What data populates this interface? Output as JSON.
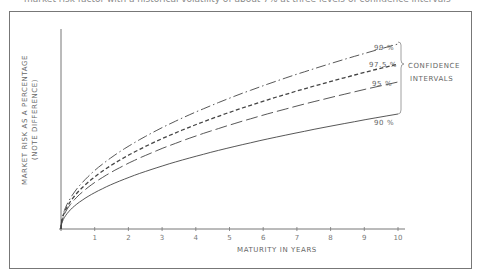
{
  "caption": "market risk factor with a historical volatility of about 7% at three levels of confidence intervals",
  "chart_data": {
    "type": "line",
    "title": "",
    "xlabel": "MATURITY IN YEARS",
    "ylabel": "MARKET RISK AS A PERCENTAGE",
    "ylabel_note": "(NOTE DIFFERENCE)",
    "x_ticks": [
      "1",
      "2",
      "3",
      "4",
      "5",
      "6",
      "7",
      "8",
      "9",
      "10"
    ],
    "xlim": [
      0,
      10
    ],
    "ylim": [
      0,
      100
    ],
    "y_ticks": [],
    "grid": false,
    "x": [
      0,
      0.25,
      0.5,
      1,
      2,
      3,
      4,
      5,
      6,
      7,
      8,
      9,
      10
    ],
    "series": [
      {
        "name": "99 %",
        "style": "dash-dot",
        "values": [
          0,
          14.6,
          20.7,
          29.2,
          41.4,
          50.7,
          58.5,
          65.4,
          71.6,
          77.4,
          82.7,
          87.8,
          92.5
        ]
      },
      {
        "name": "97.5 %",
        "style": "short-dash",
        "values": [
          0,
          13.0,
          18.4,
          26.1,
          36.9,
          45.2,
          52.2,
          58.3,
          63.9,
          69.0,
          73.8,
          78.3,
          82.5
        ]
      },
      {
        "name": "95 %",
        "style": "long-dash",
        "values": [
          0,
          11.6,
          16.4,
          23.2,
          32.9,
          40.3,
          46.5,
          52.0,
          56.9,
          61.5,
          65.7,
          69.7,
          73.5
        ]
      },
      {
        "name": "90 %",
        "style": "solid",
        "values": [
          0,
          9.1,
          12.9,
          18.2,
          25.7,
          31.5,
          36.4,
          40.7,
          44.5,
          48.1,
          51.4,
          54.5,
          57.5
        ]
      }
    ],
    "annotations": [
      "CONFIDENCE",
      "INTERVALS"
    ],
    "legend_position": "right, inline labels at curve ends"
  },
  "labels": {
    "series_99": "99 %",
    "series_975": "97.5 %",
    "series_95": "95 %",
    "series_90": "90 %",
    "bracket_line1": "CONFIDENCE",
    "bracket_line2": "INTERVALS",
    "ylabel": "MARKET RISK AS A PERCENTAGE",
    "ylabel_note": "(NOTE DIFFERENCE)",
    "xlabel": "MATURITY IN YEARS"
  }
}
